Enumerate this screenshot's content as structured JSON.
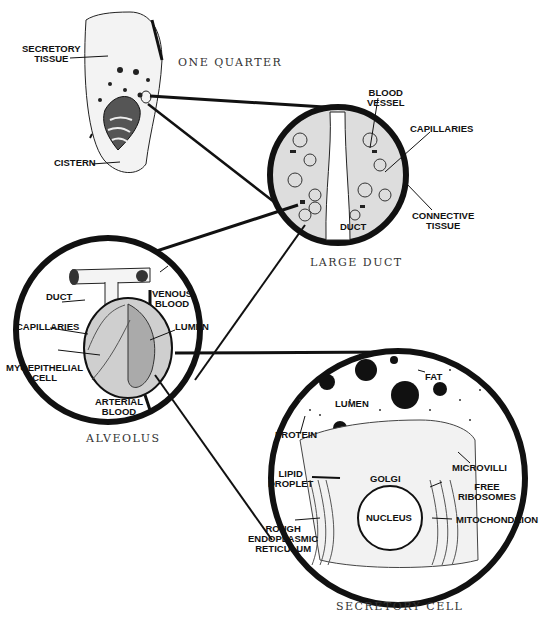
{
  "diagram": {
    "panels": [
      {
        "id": "quarter",
        "caption": "ONE QUARTER",
        "labels": {
          "secretory_tissue": "SECRETORY\nTISSUE",
          "cistern": "CISTERN"
        }
      },
      {
        "id": "large_duct",
        "caption": "LARGE DUCT",
        "labels": {
          "blood_vessel": "BLOOD\nVESSEL",
          "capillaries": "CAPILLARIES",
          "connective_tissue": "CONNECTIVE\nTISSUE",
          "duct": "DUCT"
        }
      },
      {
        "id": "alveolus",
        "caption": "ALVEOLUS",
        "labels": {
          "duct": "DUCT",
          "venous_blood": "VENOUS\nBLOOD",
          "capillaries": "CAPILLARIES",
          "lumen": "LUMEN",
          "myoepithelial_cell": "MYOEPITHELIAL\nCELL",
          "arterial_blood": "ARTERIAL\nBLOOD"
        }
      },
      {
        "id": "secretory_cell",
        "caption": "SECRETORY CELL",
        "labels": {
          "fat": "FAT",
          "lumen": "LUMEN",
          "protein": "PROTEIN",
          "microvilli": "MICROVILLI",
          "lipid_droplet": "LIPID\nDROPLET",
          "golgi": "GOLGI",
          "free_ribosomes": "FREE\nRIBOSOMES",
          "nucleus": "NUCLEUS",
          "mitochondrion": "MITOCHONDRION",
          "rough_er": "ROUGH\nENDOPLASMIC\nRETICULUM"
        }
      }
    ]
  }
}
